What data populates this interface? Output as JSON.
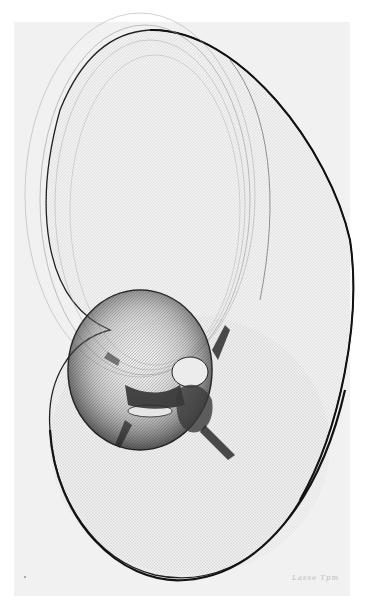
{
  "artwork": {
    "type": "plotter line drawing",
    "description": "Abstract computer plotter drawing of nested swept ellipses forming a shell/torus-like form on paper",
    "signature": "Lasse Tpm",
    "colors": {
      "background": "#ffffff",
      "paper": "#f1f1f1",
      "ink": "#1a1a1a"
    }
  }
}
